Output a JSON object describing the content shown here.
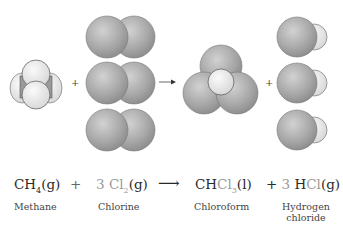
{
  "reaction": {
    "reactant1": {
      "formula_main": "CH",
      "formula_sub": "4",
      "state": "(g)",
      "name": "Methane"
    },
    "plus1": "+",
    "reactant2": {
      "coef": "3 ",
      "formula_main": "Cl",
      "formula_sub": "2",
      "state": "(g)",
      "name": "Chlorine"
    },
    "arrow": "⟶",
    "product1": {
      "formula_a": "CH",
      "formula_b": "Cl",
      "formula_sub": "3",
      "state": "(l)",
      "name": "Chloroform"
    },
    "plus2": "+ ",
    "product2": {
      "coef": "3 ",
      "formula_a": "H",
      "formula_b": "Cl",
      "state": "(g)",
      "name_line1": "Hydrogen",
      "name_line2": "chloride"
    }
  },
  "diagram": {
    "plus_symbol": "+",
    "colors": {
      "chlorine": "#a8a8a8",
      "hydrogen": "#ececec",
      "carbon": "#8c8c8c",
      "outline": "#555555"
    }
  }
}
